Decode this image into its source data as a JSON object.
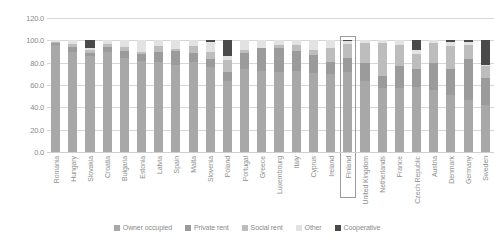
{
  "chart_data": {
    "type": "bar",
    "stacked": true,
    "stacked_percent": true,
    "title": "",
    "subtitle": "",
    "xlabel": "",
    "ylabel": "",
    "ylim": [
      0,
      120
    ],
    "yticks": [
      "0.0",
      "20.0",
      "40.0",
      "60.0",
      "80.0",
      "100.0",
      "120.0"
    ],
    "ytick_values": [
      0,
      20,
      40,
      60,
      80,
      100,
      120
    ],
    "grid": true,
    "legend_position": "bottom",
    "highlighted_category": "Finland",
    "categories": [
      "Romania",
      "Hungary",
      "Slovakia",
      "Croatia",
      "Bulgaria",
      "Estonia",
      "Latvia",
      "Spain",
      "Malta",
      "Slovenia",
      "Poland",
      "Portugal",
      "Greece",
      "Luxembourg",
      "Italy",
      "Cyprus",
      "Ireland",
      "Finland",
      "United Kingdom",
      "Netherlands",
      "France",
      "Czech Republic",
      "Austria",
      "Denmark",
      "Germany",
      "Sweden"
    ],
    "series": [
      {
        "name": "Owner occupied",
        "color": "#a8a8a8",
        "values": [
          96.1,
          90.0,
          86.0,
          90.0,
          84.3,
          81.5,
          81.0,
          78.2,
          80.5,
          76.0,
          64.0,
          74.5,
          73.0,
          72.0,
          72.5,
          71.0,
          69.5,
          71.5,
          63.5,
          57.5,
          57.0,
          58.0,
          55.5,
          51.0,
          46.5,
          42.0
        ]
      },
      {
        "name": "Private rent",
        "color": "#9b9b9b",
        "values": [
          1.2,
          4.0,
          2.5,
          4.5,
          6.5,
          6.5,
          9.0,
          12.5,
          8.5,
          7.5,
          8.0,
          14.5,
          20.0,
          21.5,
          18.0,
          15.5,
          11.5,
          13.0,
          16.5,
          10.5,
          20.0,
          16.0,
          24.5,
          23.0,
          36.5,
          24.0
        ]
      },
      {
        "name": "Social rent",
        "color": "#bdbdbd",
        "values": [
          1.0,
          3.0,
          3.0,
          2.0,
          3.0,
          2.0,
          5.0,
          2.0,
          6.0,
          6.5,
          10.0,
          2.0,
          0.5,
          2.0,
          5.5,
          4.5,
          12.5,
          12.0,
          17.5,
          30.0,
          18.5,
          14.0,
          17.5,
          21.0,
          12.5,
          11.0
        ]
      },
      {
        "name": "Other",
        "color": "#e2e2e2",
        "values": [
          1.7,
          3.0,
          2.0,
          3.5,
          6.2,
          10.0,
          5.0,
          7.3,
          5.0,
          9.0,
          4.0,
          9.0,
          6.5,
          4.5,
          4.0,
          9.0,
          6.5,
          3.0,
          2.5,
          2.0,
          4.5,
          3.0,
          2.5,
          3.5,
          3.0,
          1.0
        ]
      },
      {
        "name": "Cooperative",
        "color": "#4a4a4a",
        "values": [
          0.0,
          0.0,
          6.5,
          0.0,
          0.0,
          0.0,
          0.0,
          0.0,
          0.0,
          1.0,
          14.0,
          0.0,
          0.0,
          0.0,
          0.0,
          0.0,
          0.0,
          0.5,
          0.0,
          0.0,
          0.0,
          9.0,
          0.0,
          1.5,
          1.5,
          22.0
        ]
      }
    ]
  }
}
